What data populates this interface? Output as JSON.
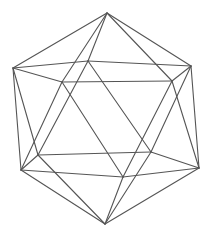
{
  "figure": {
    "line_color": "#555555",
    "background": "#ffffff",
    "vertices": {
      "top": "apex",
      "upper_left": "upper ring",
      "upper_back": "upper ring",
      "upper_right": "upper ring",
      "upper_mid_right": "upper ring",
      "upper_mid_left": "upper ring",
      "lower_outer_left": "lower ring",
      "lower_mid_left": "lower ring",
      "lower_mid_right": "lower ring",
      "lower_outer_right": "lower ring",
      "lower_front": "lower ring",
      "bottom": "apex"
    },
    "edges": [
      [
        "top",
        "upper_left"
      ],
      [
        "top",
        "upper_back"
      ],
      [
        "top",
        "upper_right"
      ],
      [
        "top",
        "upper_mid_right"
      ],
      [
        "top",
        "upper_mid_left"
      ],
      [
        "upper_left",
        "upper_back"
      ],
      [
        "upper_back",
        "upper_right"
      ],
      [
        "upper_right",
        "upper_mid_right"
      ],
      [
        "upper_mid_right",
        "upper_mid_left"
      ],
      [
        "upper_mid_left",
        "upper_left"
      ],
      [
        "upper_left",
        "lower_outer_left"
      ],
      [
        "upper_left",
        "lower_mid_left"
      ],
      [
        "upper_back",
        "lower_mid_left"
      ],
      [
        "upper_back",
        "lower_mid_right"
      ],
      [
        "upper_right",
        "lower_mid_right"
      ],
      [
        "upper_right",
        "lower_outer_right"
      ],
      [
        "upper_mid_right",
        "lower_outer_right"
      ],
      [
        "upper_mid_right",
        "lower_front"
      ],
      [
        "upper_mid_left",
        "lower_front"
      ],
      [
        "upper_mid_left",
        "lower_outer_left"
      ],
      [
        "lower_outer_left",
        "lower_mid_left"
      ],
      [
        "lower_mid_left",
        "lower_mid_right"
      ],
      [
        "lower_mid_right",
        "lower_outer_right"
      ],
      [
        "lower_outer_right",
        "lower_front"
      ],
      [
        "lower_front",
        "lower_outer_left"
      ],
      [
        "bottom",
        "lower_outer_left"
      ],
      [
        "bottom",
        "lower_mid_left"
      ],
      [
        "bottom",
        "lower_mid_right"
      ],
      [
        "bottom",
        "lower_outer_right"
      ],
      [
        "bottom",
        "lower_front"
      ]
    ]
  }
}
